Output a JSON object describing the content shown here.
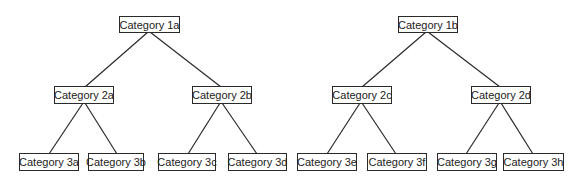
{
  "trees": [
    {
      "root": {
        "id": "1a",
        "label": "Category 1a"
      },
      "children": [
        {
          "id": "2a",
          "label": "Category 2a",
          "children": [
            {
              "id": "3a",
              "label": "Category 3a"
            },
            {
              "id": "3b",
              "label": "Category 3b"
            }
          ]
        },
        {
          "id": "2b",
          "label": "Category 2b",
          "children": [
            {
              "id": "3c",
              "label": "Category 3c"
            },
            {
              "id": "3d",
              "label": "Category 3d"
            }
          ]
        }
      ]
    },
    {
      "root": {
        "id": "1b",
        "label": "Category 1b"
      },
      "children": [
        {
          "id": "2c",
          "label": "Category 2c",
          "children": [
            {
              "id": "3e",
              "label": "Category 3e"
            },
            {
              "id": "3f",
              "label": "Category 3f"
            }
          ]
        },
        {
          "id": "2d",
          "label": "Category 2d",
          "children": [
            {
              "id": "3g",
              "label": "Category 3g"
            },
            {
              "id": "3h",
              "label": "Category 3h"
            }
          ]
        }
      ]
    }
  ],
  "nodes": {
    "n1a": "Category 1a",
    "n2a": "Category 2a",
    "n2b": "Category 2b",
    "n3a": "Category 3a",
    "n3b": "Category 3b",
    "n3c": "Category 3c",
    "n3d": "Category 3d",
    "n1b": "Category 1b",
    "n2c": "Category 2c",
    "n2d": "Category 2d",
    "n3e": "Category 3e",
    "n3f": "Category 3f",
    "n3g": "Category 3g",
    "n3h": "Category 3h"
  },
  "colors": {
    "line": "#2a2a2a",
    "border": "#2a2a2a",
    "text": "#222222",
    "background": "#ffffff"
  }
}
